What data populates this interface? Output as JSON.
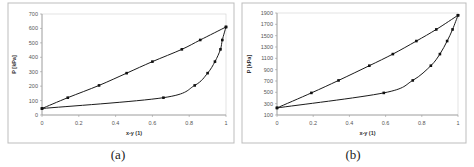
{
  "captions": [
    "(a)",
    "(b)"
  ],
  "chart_data": [
    {
      "type": "line",
      "title": "",
      "xlabel": "x-y (1)",
      "ylabel": "P [kPa]",
      "xlim": [
        0,
        1
      ],
      "ylim": [
        0,
        700
      ],
      "xticks": [
        "0",
        "0.2",
        "0.4",
        "0.6",
        "0.8",
        "1"
      ],
      "yticks": [
        "0",
        "100",
        "200",
        "300",
        "400",
        "500",
        "600",
        "700"
      ],
      "grid": false,
      "legend": null,
      "series": [
        {
          "name": "upper (bubble/x) line",
          "x": [
            0,
            0.14,
            0.31,
            0.46,
            0.6,
            0.76,
            0.86,
            1.0
          ],
          "y": [
            45,
            120,
            205,
            290,
            370,
            455,
            520,
            610
          ]
        },
        {
          "name": "lower (dew/y) curve",
          "x": [
            0,
            0.66,
            0.83,
            0.9,
            0.94,
            0.97,
            0.98,
            1.0
          ],
          "y": [
            45,
            120,
            205,
            290,
            370,
            455,
            520,
            610
          ]
        }
      ]
    },
    {
      "type": "line",
      "title": "",
      "xlabel": "x-y (1)",
      "ylabel": "P [kPa]",
      "xlim": [
        0,
        1
      ],
      "ylim": [
        100,
        1900
      ],
      "xticks": [
        "0",
        "0.2",
        "0.4",
        "0.6",
        "0.8",
        "1"
      ],
      "yticks": [
        "100",
        "300",
        "500",
        "700",
        "900",
        "1100",
        "1300",
        "1500",
        "1700",
        "1900"
      ],
      "grid": false,
      "legend": null,
      "series": [
        {
          "name": "upper (bubble/x) line",
          "x": [
            0,
            0.19,
            0.34,
            0.51,
            0.64,
            0.77,
            0.88,
            1.0
          ],
          "y": [
            225,
            490,
            710,
            970,
            1175,
            1405,
            1610,
            1860
          ]
        },
        {
          "name": "lower (dew/y) curve",
          "x": [
            0,
            0.59,
            0.75,
            0.85,
            0.9,
            0.94,
            0.97,
            1.0
          ],
          "y": [
            225,
            490,
            710,
            970,
            1175,
            1405,
            1610,
            1860
          ]
        }
      ]
    }
  ]
}
